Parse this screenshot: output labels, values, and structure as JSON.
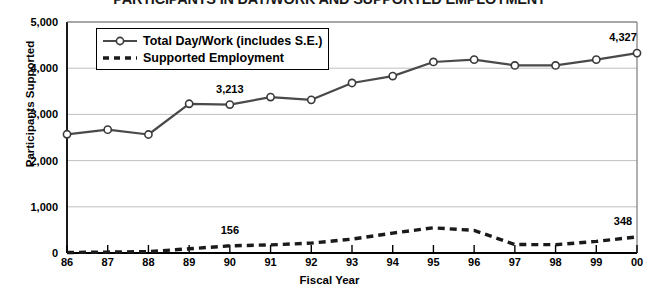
{
  "chart_data": {
    "type": "line",
    "title": "PARTICIPANTS IN DAY/WORK AND SUPPORTED EMPLOYMENT",
    "xlabel": "Fiscal Year",
    "ylabel": "Participants Supported",
    "categories": [
      "86",
      "87",
      "88",
      "89",
      "90",
      "91",
      "92",
      "93",
      "94",
      "95",
      "96",
      "97",
      "98",
      "99",
      "00"
    ],
    "ylim": [
      0,
      5000
    ],
    "yticks": [
      0,
      1000,
      2000,
      3000,
      4000,
      5000
    ],
    "ytick_labels": [
      "0",
      "1,000",
      "2,000",
      "3,000",
      "4,000",
      "5,000"
    ],
    "grid": true,
    "legend_position": "top-left",
    "series": [
      {
        "name": "Total Day/Work (includes S.E.)",
        "style": "solid-marker",
        "color": "#4a4a4a",
        "values": [
          2570,
          2670,
          2565,
          3230,
          3213,
          3375,
          3315,
          3680,
          3830,
          4135,
          4185,
          4060,
          4060,
          4185,
          4327
        ]
      },
      {
        "name": "Supported Employment",
        "style": "dashed",
        "color": "#1a1a1a",
        "values": [
          10,
          20,
          30,
          90,
          156,
          175,
          215,
          300,
          430,
          545,
          490,
          185,
          180,
          250,
          348
        ]
      }
    ],
    "annotations": [
      {
        "label": "3,213",
        "series": "Total Day/Work (includes S.E.)",
        "category": "90",
        "value": 3213
      },
      {
        "label": "4,327",
        "series": "Total Day/Work (includes S.E.)",
        "category": "00",
        "value": 4327
      },
      {
        "label": "156",
        "series": "Supported Employment",
        "category": "90",
        "value": 156
      },
      {
        "label": "348",
        "series": "Supported Employment",
        "category": "00",
        "value": 348
      }
    ]
  }
}
